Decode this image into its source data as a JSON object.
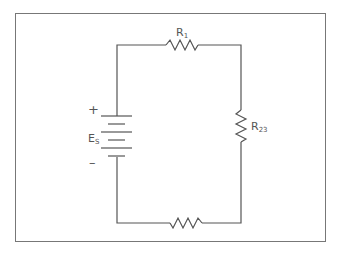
{
  "diagram": {
    "type": "series-circuit",
    "source": {
      "label_main": "E",
      "label_sub": "S",
      "positive_sign": "+",
      "negative_sign": "–"
    },
    "components": [
      {
        "id": "R1",
        "label_main": "R",
        "label_sub": "1",
        "position": "top"
      },
      {
        "id": "R23",
        "label_main": "R",
        "label_sub": "23",
        "position": "right"
      },
      {
        "id": "R_bottom",
        "label_main": "",
        "label_sub": "",
        "position": "bottom"
      }
    ],
    "colors": {
      "wire": "#555555",
      "frame": "#777777",
      "text": "#555555",
      "background": "#ffffff"
    }
  }
}
